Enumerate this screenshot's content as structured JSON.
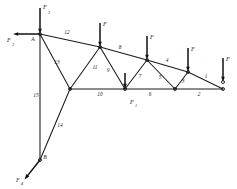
{
  "figure": {
    "type": "truss-diagram",
    "stroke_color": "#1a1a1a",
    "background": "#ffffff"
  },
  "nodes": [
    {
      "id": "A",
      "label": "A",
      "x": 40,
      "y": 34,
      "show_label": true,
      "show_dot": true
    },
    {
      "id": "B",
      "label": "B",
      "x": 40,
      "y": 160,
      "show_label": true,
      "show_dot": true
    },
    {
      "id": "T2",
      "label": "",
      "x": 100,
      "y": 47,
      "show_label": false,
      "show_dot": true
    },
    {
      "id": "T3",
      "label": "",
      "x": 147,
      "y": 60,
      "show_label": false,
      "show_dot": true
    },
    {
      "id": "T4",
      "label": "",
      "x": 188,
      "y": 72,
      "show_label": false,
      "show_dot": true
    },
    {
      "id": "T5",
      "label": "",
      "x": 223,
      "y": 82,
      "show_label": false,
      "show_dot": true
    },
    {
      "id": "C",
      "label": "",
      "x": 70,
      "y": 89,
      "show_label": false,
      "show_dot": true
    },
    {
      "id": "D",
      "label": "",
      "x": 125,
      "y": 89,
      "show_label": false,
      "show_dot": true
    },
    {
      "id": "E",
      "label": "",
      "x": 175,
      "y": 89,
      "show_label": false,
      "show_dot": true
    },
    {
      "id": "G",
      "label": "",
      "x": 223,
      "y": 89,
      "show_label": false,
      "show_dot": true
    }
  ],
  "members": [
    {
      "number": "1",
      "from": "T4",
      "to": "G",
      "label_x": 206,
      "label_y": 78
    },
    {
      "number": "2",
      "from": "E",
      "to": "G",
      "label_x": 199,
      "label_y": 96
    },
    {
      "number": "3",
      "from": "T4",
      "to": "E",
      "label_x": 183,
      "label_y": 83
    },
    {
      "number": "4",
      "from": "T3",
      "to": "T4",
      "label_x": 167,
      "label_y": 62
    },
    {
      "number": "5",
      "from": "T3",
      "to": "E",
      "label_x": 160,
      "label_y": 79
    },
    {
      "number": "6",
      "from": "D",
      "to": "E",
      "label_x": 150,
      "label_y": 96
    },
    {
      "number": "7",
      "from": "T3",
      "to": "D",
      "label_x": 140,
      "label_y": 78
    },
    {
      "number": "8",
      "from": "T2",
      "to": "T3",
      "label_x": 120,
      "label_y": 49
    },
    {
      "number": "9",
      "from": "T2",
      "to": "D",
      "label_x": 108,
      "label_y": 72
    },
    {
      "number": "10",
      "from": "C",
      "to": "D",
      "label_x": 100,
      "label_y": 96
    },
    {
      "number": "11",
      "from": "T2",
      "to": "C",
      "label_x": 95,
      "label_y": 69
    },
    {
      "number": "12",
      "from": "A",
      "to": "T2",
      "label_x": 67,
      "label_y": 34
    },
    {
      "number": "13",
      "from": "A",
      "to": "C",
      "label_x": 57,
      "label_y": 64
    },
    {
      "number": "14",
      "from": "B",
      "to": "C",
      "label_x": 60,
      "label_y": 127
    },
    {
      "number": "15",
      "from": "A",
      "to": "B",
      "label_x": 36,
      "label_y": 97
    }
  ],
  "forces": [
    {
      "id": "f-top-a",
      "label": "F",
      "subscript": "2",
      "direction": "down",
      "at": "A",
      "x": 40,
      "y": 34,
      "length": 26,
      "label_x": 45,
      "label_y": 9,
      "sub_x": 49,
      "sub_y": 14
    },
    {
      "id": "f-left-a",
      "label": "F",
      "subscript": "3",
      "direction": "left",
      "at": "A",
      "x": 40,
      "y": 34,
      "length": 27,
      "label_x": 9,
      "label_y": 42,
      "sub_x": 13,
      "sub_y": 46
    },
    {
      "id": "f-top-2",
      "label": "F",
      "subscript": "",
      "direction": "down",
      "at": "T2",
      "x": 100,
      "y": 47,
      "length": 24,
      "label_x": 105,
      "label_y": 26,
      "sub_x": 0,
      "sub_y": 0
    },
    {
      "id": "f-top-3",
      "label": "F",
      "subscript": "",
      "direction": "down",
      "at": "T3",
      "x": 147,
      "y": 60,
      "length": 24,
      "label_x": 152,
      "label_y": 39,
      "sub_x": 0,
      "sub_y": 0
    },
    {
      "id": "f-top-4",
      "label": "F",
      "subscript": "",
      "direction": "down",
      "at": "T4",
      "x": 188,
      "y": 72,
      "length": 24,
      "label_x": 193,
      "label_y": 51,
      "sub_x": 0,
      "sub_y": 0
    },
    {
      "id": "f-top-5",
      "label": "F",
      "subscript": "",
      "direction": "down",
      "at": "T5",
      "x": 223,
      "y": 82,
      "length": 24,
      "label_x": 228,
      "label_y": 61,
      "sub_x": 0,
      "sub_y": 0
    },
    {
      "id": "f-bot-d",
      "label": "F",
      "subscript": "1",
      "direction": "down",
      "at": "D",
      "x": 125,
      "y": 89,
      "length": 16,
      "label_x": 132,
      "label_y": 104,
      "sub_x": 136,
      "sub_y": 107
    },
    {
      "id": "f-node-b",
      "label": "F",
      "subscript": "4",
      "direction": "downleft",
      "at": "B",
      "x": 40,
      "y": 160,
      "length": 25,
      "label_x": 18,
      "label_y": 182,
      "sub_x": 22,
      "sub_y": 185
    }
  ],
  "node_labels": [
    {
      "text": "A",
      "x": 33,
      "y": 41
    },
    {
      "text": "B",
      "x": 45,
      "y": 159
    }
  ]
}
